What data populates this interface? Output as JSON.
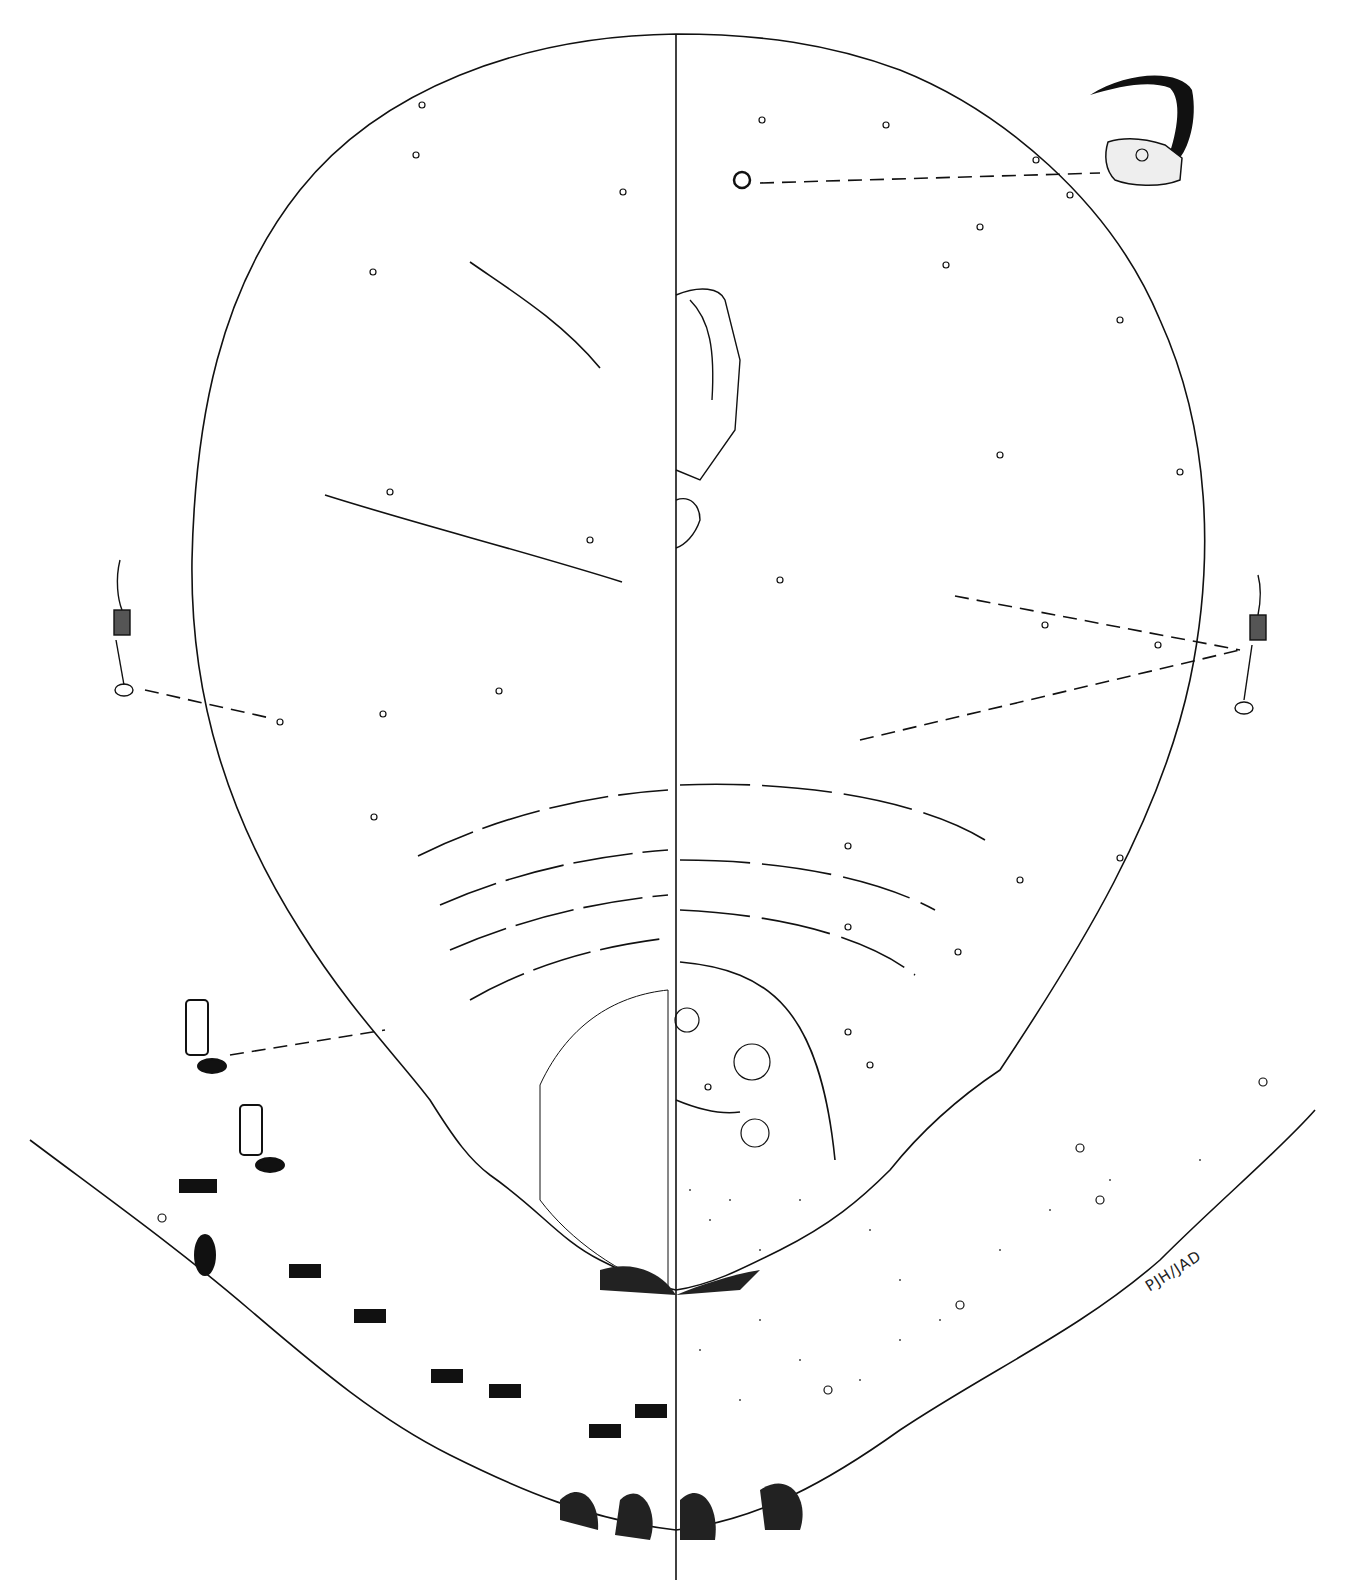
{
  "figure": {
    "type": "scientific morphology illustration",
    "signature": "PJH/JAD",
    "colors": {
      "ink": "#111111",
      "paper": "#ffffff"
    }
  }
}
